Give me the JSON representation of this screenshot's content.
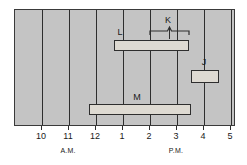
{
  "chart_data": {
    "type": "bar",
    "orientation": "horizontal",
    "title": "",
    "xlabel": "",
    "ylabel": "",
    "grid": true,
    "legend": null,
    "axis": {
      "tick_labels": [
        "10",
        "11",
        "12",
        "1",
        "2",
        "3",
        "4",
        "5"
      ],
      "tick_values": [
        10,
        11,
        12,
        13,
        14,
        15,
        16,
        17
      ],
      "tick_x_px": [
        41,
        68,
        95,
        122,
        149,
        176,
        203,
        230
      ],
      "period_labels": [
        {
          "text": "A.M.",
          "x_px": 68
        },
        {
          "text": "P.M.",
          "x_px": 176
        }
      ],
      "xlim_px": [
        14,
        235
      ],
      "xlim_hours": [
        9,
        17.2
      ]
    },
    "bars": [
      {
        "label": "L",
        "start_hour": 12.7,
        "end_hour": 15.5,
        "x_px": 113,
        "width_px": 75,
        "y_px": 39,
        "height_px": 11,
        "label_x_px": 120,
        "label_y_px": 27
      },
      {
        "label": "J",
        "start_hour": 16.1,
        "end_hour": 17.1,
        "x_px": 190,
        "width_px": 28,
        "y_px": 69,
        "height_px": 13,
        "label_x_px": 204,
        "label_y_px": 57
      },
      {
        "label": "M",
        "start_hour": 11.8,
        "end_hour": 15.6,
        "x_px": 88,
        "width_px": 102,
        "y_px": 103,
        "height_px": 11,
        "label_x_px": 137,
        "label_y_px": 92
      }
    ],
    "annotations": [
      {
        "label": "K",
        "type": "brace",
        "start_hour": 14.0,
        "end_hour": 15.5,
        "x_px": 149,
        "width_px": 39,
        "y_px": 29,
        "label_x_px": 168,
        "label_y_px": 15
      }
    ]
  },
  "colors": {
    "plot_background": "#c4c4c4",
    "bar_fill": "#dedad2",
    "line": "#2e2e2e",
    "text": "#1a1a1a",
    "page_background": "#ffffff"
  }
}
